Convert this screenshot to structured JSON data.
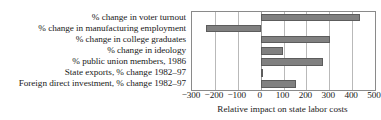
{
  "figure": {
    "cropped_line_above": "",
    "bar_color": "#808080",
    "bar_edge_color": "#5c5c5c",
    "grid_color": "#b9b9b9",
    "axis_color": "#8a8a8a"
  },
  "chart_data": {
    "type": "bar",
    "orientation": "horizontal",
    "title": "",
    "subtitle": "",
    "xlabel": "Relative impact on state labor costs",
    "ylabel": "",
    "xlim": [
      -300,
      500
    ],
    "ylim": null,
    "grid": true,
    "legend": null,
    "legend_position": "none",
    "xticks": [
      -300,
      -200,
      -100,
      0,
      100,
      200,
      300,
      400,
      500
    ],
    "xtick_labels": [
      "−300",
      "−200",
      "−100",
      "0",
      "100",
      "200",
      "300",
      "400",
      "500"
    ],
    "categories": [
      "% change in voter turnout",
      "% change in manufacturing employment",
      "% change in college graduates",
      "% change in ideology",
      "% public union members, 1986",
      "State exports, % change 1982–97",
      "Foreign direct investment, % change 1982–97"
    ],
    "values": [
      434,
      -239,
      303,
      98,
      273,
      6,
      155
    ],
    "series": [
      {
        "name": "Relative impact on state labor costs",
        "values": [
          434,
          -239,
          303,
          98,
          273,
          6,
          155
        ]
      }
    ],
    "annotations": []
  }
}
